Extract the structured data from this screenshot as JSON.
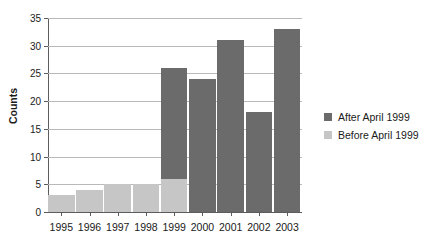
{
  "chart_data": {
    "type": "bar",
    "stacked": true,
    "title": "",
    "xlabel": "",
    "ylabel": "Counts",
    "categories": [
      "1995",
      "1996",
      "1997",
      "1998",
      "1999",
      "2000",
      "2001",
      "2002",
      "2003"
    ],
    "series": [
      {
        "name": "After April 1999",
        "color": "#6b6b6b",
        "values": [
          0,
          0,
          0,
          0,
          20,
          24,
          31,
          18,
          33
        ]
      },
      {
        "name": "Before April 1999",
        "color": "#c6c6c6",
        "values": [
          3,
          4,
          5,
          5,
          6,
          0,
          0,
          0,
          0
        ]
      }
    ],
    "totals": [
      3,
      4,
      5,
      5,
      26,
      24,
      31,
      18,
      33
    ],
    "ylim": [
      0,
      35
    ],
    "yticks": [
      0,
      5,
      10,
      15,
      20,
      25,
      30,
      35
    ],
    "ytick_labels": [
      "0",
      "5",
      "10",
      "15",
      "20",
      "25",
      "30",
      "35"
    ],
    "grid": "horizontal",
    "legend_position": "right",
    "axis_color": "#5c5c5c",
    "grid_color": "#b9b9b9",
    "background": "#ffffff"
  }
}
